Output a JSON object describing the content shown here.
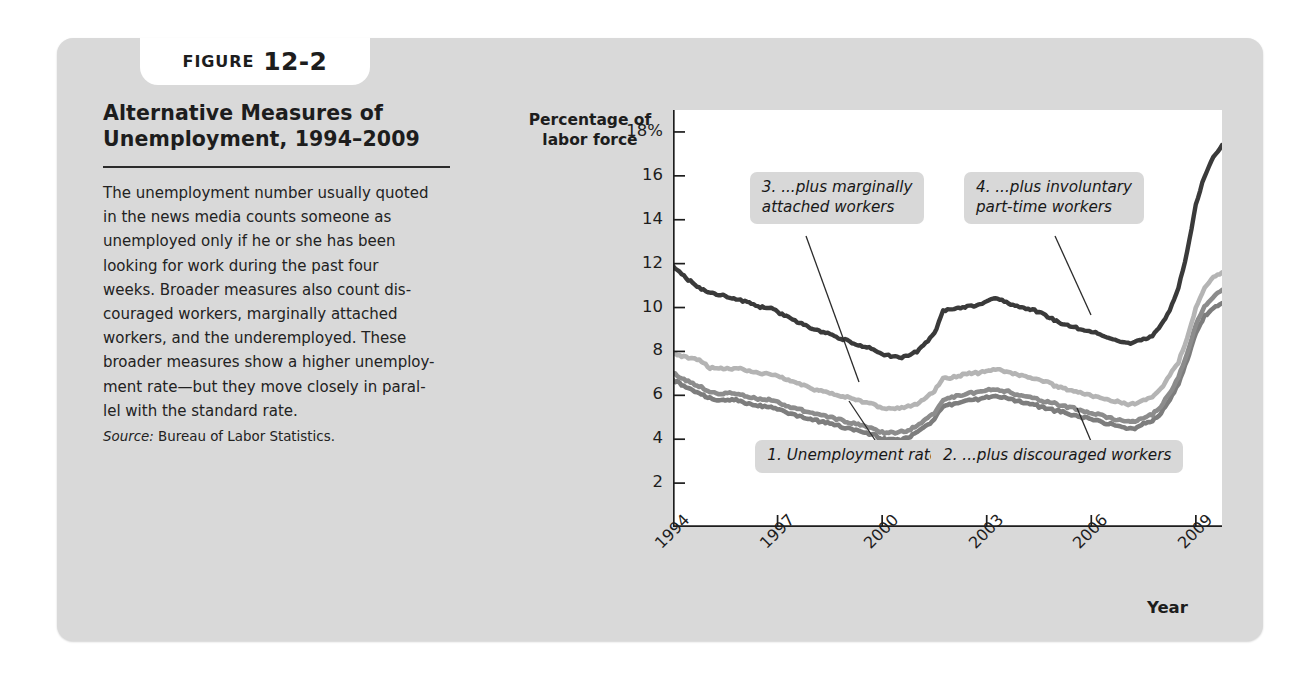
{
  "figure": {
    "tab_word": "FIGURE",
    "tab_number": "12-2",
    "title": "Alternative Measures of\nUnemployment, 1994–2009",
    "body": "The unemployment number usually quoted\nin the news media counts someone as\nunemployed only if he or she has been\nlooking for work during the past four\nweeks. Broader measures also count dis-\ncouraged workers, marginally attached\nworkers, and the underemployed. These\nbroader measures show a higher unemploy-\nment rate—but they move closely in paral-\nlel with the standard rate.",
    "source_label": "Source:",
    "source_text": "Bureau of Labor Statistics."
  },
  "colors": {
    "panel_background": "#d9d9d9",
    "plot_background": "#ffffff",
    "callout_background": "#d8d8d8",
    "series4_dark": "#3a3a3a",
    "series3_light": "#b4b4b4",
    "series2_medium": "#8c8c8c",
    "series1_medium": "#7d7d7d",
    "axis": "#1d1d1d",
    "text": "#1d1d1d"
  },
  "chart_data": {
    "type": "line",
    "title": "Alternative Measures of Unemployment, 1994–2009",
    "ylabel": "Percentage of\nlabor force",
    "xlabel": "Year",
    "ylim": [
      0,
      19
    ],
    "xlim": [
      1994,
      2009.75
    ],
    "grid": false,
    "legend": "annotations",
    "ytick_labels": [
      "18%",
      "16",
      "14",
      "12",
      "10",
      "8",
      "6",
      "4",
      "2"
    ],
    "ytick_values": [
      18,
      16,
      14,
      12,
      10,
      8,
      6,
      4,
      2
    ],
    "xtick_labels": [
      "1994",
      "1997",
      "2000",
      "2003",
      "2006",
      "2009"
    ],
    "xtick_values": [
      1994,
      1997,
      2000,
      2003,
      2006,
      2009
    ],
    "annotations": [
      {
        "id": 1,
        "text": "1. Unemployment rate...",
        "series": "series1",
        "x_pct": 15.0,
        "y_px": 330
      },
      {
        "id": 2,
        "text": "2. ...plus discouraged workers",
        "series": "series2",
        "x_pct": 47.0,
        "y_px": 330
      },
      {
        "id": 3,
        "text": "3. ...plus marginally\nattached workers",
        "series": "series3",
        "x_pct": 14.0,
        "y_px": 62
      },
      {
        "id": 4,
        "text": "4. ...plus involuntary\npart-time workers",
        "series": "series4",
        "x_pct": 53.0,
        "y_px": 62
      }
    ],
    "x": [
      1994.0,
      1994.25,
      1994.5,
      1994.75,
      1995.0,
      1995.25,
      1995.5,
      1995.75,
      1996.0,
      1996.25,
      1996.5,
      1996.75,
      1997.0,
      1997.25,
      1997.5,
      1997.75,
      1998.0,
      1998.25,
      1998.5,
      1998.75,
      1999.0,
      1999.25,
      1999.5,
      1999.75,
      2000.0,
      2000.25,
      2000.5,
      2000.75,
      2001.0,
      2001.25,
      2001.5,
      2001.75,
      2002.0,
      2002.25,
      2002.5,
      2002.75,
      2003.0,
      2003.25,
      2003.5,
      2003.75,
      2004.0,
      2004.25,
      2004.5,
      2004.75,
      2005.0,
      2005.25,
      2005.5,
      2005.75,
      2006.0,
      2006.25,
      2006.5,
      2006.75,
      2007.0,
      2007.25,
      2007.5,
      2007.75,
      2008.0,
      2008.25,
      2008.5,
      2008.75,
      2009.0,
      2009.25,
      2009.5,
      2009.75
    ],
    "series": [
      {
        "name": "4. ...plus involuntary part-time workers",
        "key": "series4",
        "color": "#3a3a3a",
        "values": [
          11.9,
          11.5,
          11.2,
          10.9,
          10.7,
          10.6,
          10.5,
          10.4,
          10.3,
          10.2,
          10.0,
          10.0,
          9.8,
          9.6,
          9.4,
          9.2,
          9.0,
          8.9,
          8.8,
          8.6,
          8.5,
          8.3,
          8.2,
          8.1,
          7.9,
          7.8,
          7.7,
          7.8,
          8.0,
          8.4,
          8.8,
          9.9,
          9.9,
          10.0,
          10.1,
          10.1,
          10.3,
          10.4,
          10.3,
          10.1,
          10.0,
          9.9,
          9.8,
          9.6,
          9.4,
          9.2,
          9.1,
          9.0,
          8.9,
          8.8,
          8.6,
          8.5,
          8.4,
          8.4,
          8.6,
          8.7,
          9.2,
          9.9,
          10.9,
          12.5,
          14.7,
          16.0,
          16.8,
          17.4
        ]
      },
      {
        "name": "3. ...plus marginally attached workers",
        "key": "series3",
        "color": "#b4b4b4",
        "values": [
          7.9,
          7.8,
          7.7,
          7.6,
          7.3,
          7.2,
          7.2,
          7.2,
          7.2,
          7.1,
          7.0,
          7.0,
          6.9,
          6.7,
          6.6,
          6.5,
          6.3,
          6.2,
          6.1,
          6.0,
          5.9,
          5.8,
          5.7,
          5.6,
          5.4,
          5.4,
          5.4,
          5.5,
          5.6,
          5.9,
          6.2,
          6.8,
          6.8,
          6.9,
          7.0,
          7.0,
          7.1,
          7.2,
          7.1,
          7.0,
          6.9,
          6.8,
          6.7,
          6.6,
          6.4,
          6.3,
          6.2,
          6.1,
          6.0,
          5.9,
          5.8,
          5.7,
          5.6,
          5.6,
          5.8,
          5.9,
          6.3,
          6.9,
          7.5,
          8.6,
          10.0,
          10.9,
          11.4,
          11.6
        ]
      },
      {
        "name": "2. ...plus discouraged workers",
        "key": "series2",
        "color": "#8c8c8c",
        "values": [
          7.0,
          6.8,
          6.6,
          6.4,
          6.2,
          6.1,
          6.1,
          6.1,
          6.0,
          5.9,
          5.8,
          5.8,
          5.7,
          5.5,
          5.4,
          5.3,
          5.2,
          5.1,
          5.0,
          4.9,
          4.8,
          4.7,
          4.6,
          4.5,
          4.3,
          4.3,
          4.3,
          4.4,
          4.6,
          4.9,
          5.2,
          5.8,
          5.9,
          6.0,
          6.1,
          6.1,
          6.2,
          6.3,
          6.2,
          6.1,
          6.0,
          5.9,
          5.8,
          5.7,
          5.6,
          5.5,
          5.4,
          5.3,
          5.2,
          5.1,
          5.0,
          4.9,
          4.8,
          4.8,
          5.0,
          5.1,
          5.5,
          6.1,
          6.8,
          7.9,
          9.2,
          10.1,
          10.5,
          10.8
        ]
      },
      {
        "name": "1. Unemployment rate...",
        "key": "series1",
        "color": "#7d7d7d",
        "values": [
          6.7,
          6.5,
          6.3,
          6.1,
          5.9,
          5.8,
          5.8,
          5.8,
          5.7,
          5.6,
          5.5,
          5.5,
          5.4,
          5.2,
          5.1,
          5.0,
          4.9,
          4.8,
          4.7,
          4.6,
          4.5,
          4.4,
          4.3,
          4.2,
          4.0,
          4.0,
          4.0,
          4.1,
          4.3,
          4.6,
          4.9,
          5.5,
          5.6,
          5.7,
          5.8,
          5.8,
          5.9,
          6.0,
          5.9,
          5.8,
          5.7,
          5.6,
          5.5,
          5.4,
          5.3,
          5.2,
          5.1,
          5.0,
          4.9,
          4.8,
          4.7,
          4.6,
          4.5,
          4.5,
          4.7,
          4.8,
          5.2,
          5.8,
          6.5,
          7.6,
          8.8,
          9.6,
          10.0,
          10.2
        ]
      }
    ]
  }
}
